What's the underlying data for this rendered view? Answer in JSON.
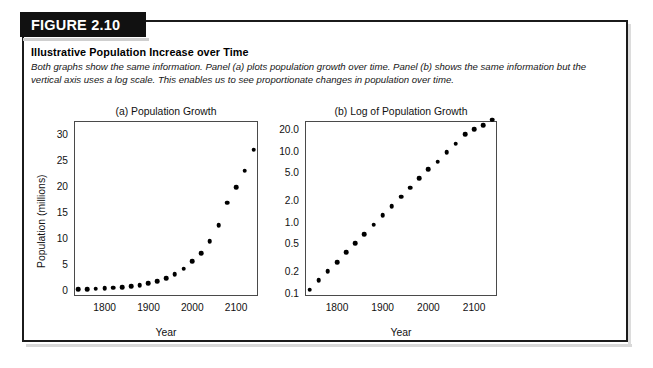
{
  "figure": {
    "badge_label": "FIGURE 2.10",
    "title": "Illustrative Population Increase over Time",
    "caption": "Both graphs show the same information. Panel (a) plots population growth over time. Panel (b) shows the same information but the vertical axis uses a log scale. This enables us to see proportionate changes in population over time.",
    "border_color": "#1b1b1b",
    "badge_bg": "#111111",
    "badge_text_color": "#ffffff",
    "marker_color": "#000000"
  },
  "chart_data": [
    {
      "type": "scatter",
      "panel": "a",
      "title": "(a) Population Growth",
      "xlabel": "Year",
      "ylabel": "Population (millions)",
      "yscale": "linear",
      "xlim": [
        1730,
        2150
      ],
      "ylim": [
        -1.2,
        32.5
      ],
      "grid": false,
      "legend": "none",
      "xticks": [
        1800,
        1900,
        2000,
        2100
      ],
      "xtick_labels": [
        "1800",
        "1900",
        "2000",
        "2100"
      ],
      "yticks": [
        0,
        5,
        10,
        15,
        20,
        25,
        30
      ],
      "ytick_labels": [
        "0",
        "5",
        "10",
        "15",
        "20",
        "25",
        "30"
      ],
      "x": [
        1740,
        1760,
        1780,
        1800,
        1820,
        1840,
        1860,
        1880,
        1900,
        1920,
        1940,
        1960,
        1980,
        2000,
        2020,
        2040,
        2060,
        2080,
        2100,
        2120,
        2140
      ],
      "values": [
        0.11,
        0.15,
        0.2,
        0.27,
        0.37,
        0.5,
        0.67,
        0.91,
        1.22,
        1.65,
        2.23,
        3.0,
        4.05,
        5.46,
        7.0,
        9.4,
        12.4,
        16.8,
        19.8,
        22.9,
        27.0,
        31.0
      ]
    },
    {
      "type": "scatter",
      "panel": "b",
      "title": "(b) Log of Population Growth",
      "xlabel": "Year",
      "ylabel": "",
      "yscale": "log",
      "xlim": [
        1730,
        2150
      ],
      "ylim": [
        0.09,
        26.0
      ],
      "grid": false,
      "legend": "none",
      "xticks": [
        1800,
        1900,
        2000,
        2100
      ],
      "xtick_labels": [
        "1800",
        "1900",
        "2000",
        "2100"
      ],
      "yticks": [
        0.1,
        0.2,
        0.5,
        1.0,
        2.0,
        5.0,
        10.0,
        20.0
      ],
      "ytick_labels": [
        "0.1",
        "0.2",
        "0.5",
        "1.0",
        "2.0",
        "5.0",
        "10.0",
        "20.0"
      ],
      "x": [
        1740,
        1760,
        1780,
        1800,
        1820,
        1840,
        1860,
        1880,
        1900,
        1920,
        1940,
        1960,
        1980,
        2000,
        2020,
        2040,
        2060,
        2080,
        2100,
        2120,
        2140
      ],
      "values": [
        0.11,
        0.15,
        0.2,
        0.27,
        0.37,
        0.5,
        0.67,
        0.91,
        1.22,
        1.65,
        2.23,
        3.0,
        4.05,
        5.46,
        7.0,
        9.4,
        12.4,
        16.8,
        19.8,
        22.9,
        27.0,
        31.0
      ]
    }
  ]
}
